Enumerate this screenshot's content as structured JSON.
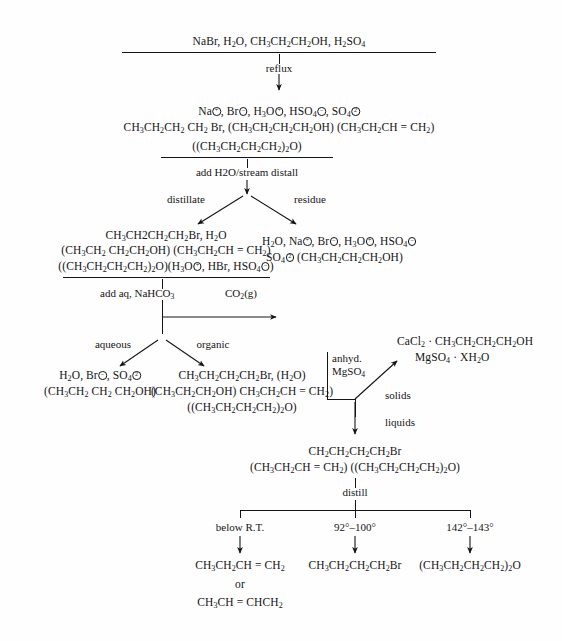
{
  "diagram": {
    "ink_color": "#141414",
    "background_color": "#fefefe"
  },
  "steps": {
    "reactants": {
      "line1": "NaBr, H2O, CH3CH2CH2OH, H2SO4"
    },
    "reflux_label": "reflux",
    "mixture": {
      "line1": "Na⊕, Br⊖, H3O⊕, HSO4⊖, SO4⊖2",
      "line2": "CH3CH2CH2 CH2 Br, (CH3CH2CH2CH2OH) (CH3CH2CH = CH2)",
      "line3": "((CH3CH2CH2CH2)2O)"
    },
    "steam_distill_label": "add H2O/stream distall",
    "branch_distillate_label": "distillate",
    "branch_residue_label": "residue",
    "distillate": {
      "line1": "CH3CH2CH2CH2Br, H2O",
      "line2": "(CH3CH2 CH2CH2OH) (CH3CH2CH = CH2)",
      "line3": "((CH3CH2CH2CH2)2O)(H3O⊕, HBr, HSO4⊖)"
    },
    "residue": {
      "line1": "H2O, Na⊕, Br⊖, H3O⊕, HSO4⊖",
      "line2": "SO4⊖2 (CH3CH2CH2CH2OH)"
    },
    "nahco3_label": "add aq, NaHCO3",
    "co2_label": "CO2(g)",
    "branch_aqueous_label": "aqueous",
    "branch_organic_label": "organic",
    "aqueous": {
      "line1": "H2O, Br⊖, SO4⊖2",
      "line2": "(CH3CH2 CH2 CH2OH)"
    },
    "organic": {
      "line1": "CH3CH2CH2CH2Br, (H2O)",
      "line2": "(CH3CH2CH2OH) CH3CH2CH = CH2)",
      "line3": "((CH3CH2CH2CH2)2O)"
    },
    "drying_agent": {
      "line1": "anhyd.",
      "line2": "MgSO4"
    },
    "solids_label": "solids",
    "solids_products": {
      "line1": "CaCl2 · CH3CH2CH2CH2OH",
      "line2": "MgSO4 · XH2O"
    },
    "liquids_label": "liquids",
    "dried_liquid": {
      "line1": "CH2CH2CH2CH2Br",
      "line2": "(CH3CH2CH = CH2) ((CH3CH2CH2CH2)2O)"
    },
    "distill_label": "distill",
    "fractions": [
      {
        "temperature": "below R.T.",
        "product_line1": "CH3CH2CH = CH2",
        "product_line2": "or",
        "product_line3": "CH3CH = CHCH2"
      },
      {
        "temperature": "92°–100°",
        "product_line1": "CH3CH2CH2CH2Br",
        "product_line2": "",
        "product_line3": ""
      },
      {
        "temperature": "142°–143°",
        "product_line1": "(CH3CH2CH2CH2)2O",
        "product_line2": "",
        "product_line3": ""
      }
    ]
  }
}
